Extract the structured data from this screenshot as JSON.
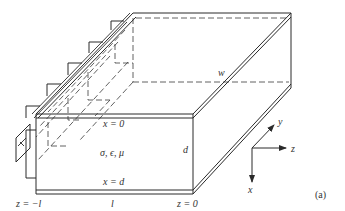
{
  "figure": {
    "tag": "(a)"
  },
  "labels": {
    "top_plate": "x = 0",
    "bottom_plate": "x = d",
    "medium": "σ, ϵ, μ",
    "height": "d",
    "width": "w",
    "length": "l",
    "left_end": "z = −l",
    "right_end": "z = 0"
  },
  "axes": {
    "x_label": "x",
    "y_label": "y",
    "z_label": "z"
  },
  "colors": {
    "line": "#2a2a2a",
    "text": "#333333",
    "background": "#ffffff"
  }
}
